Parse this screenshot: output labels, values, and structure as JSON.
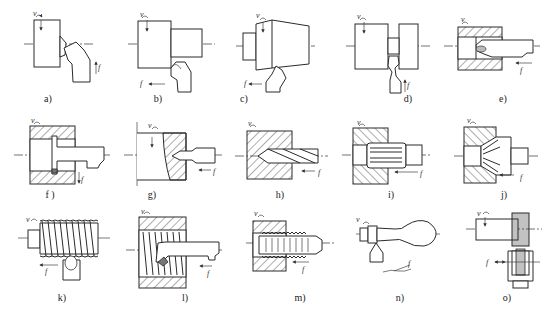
{
  "figure": {
    "symbols": {
      "speed": "v",
      "feed": "f"
    },
    "panels": [
      {
        "id": "a",
        "label": "a)",
        "operation": "facing",
        "label_pos": [
          48,
          100
        ]
      },
      {
        "id": "b",
        "label": "b)",
        "operation": "external cylindrical turning",
        "label_pos": [
          158,
          100
        ]
      },
      {
        "id": "c",
        "label": "c)",
        "operation": "taper turning",
        "label_pos": [
          244,
          100
        ]
      },
      {
        "id": "d",
        "label": "d)",
        "operation": "grooving / parting",
        "label_pos": [
          408,
          100
        ]
      },
      {
        "id": "e",
        "label": "e)",
        "operation": "boring",
        "label_pos": [
          503,
          100
        ]
      },
      {
        "id": "f",
        "label": "f )",
        "operation": "internal grooving",
        "label_pos": [
          50,
          196
        ]
      },
      {
        "id": "g",
        "label": "g)",
        "operation": "center drilling",
        "label_pos": [
          152,
          196
        ]
      },
      {
        "id": "h",
        "label": "h)",
        "operation": "drilling",
        "label_pos": [
          280,
          196
        ]
      },
      {
        "id": "i",
        "label": "i)",
        "operation": "reaming",
        "label_pos": [
          391,
          196
        ]
      },
      {
        "id": "j",
        "label": "j)",
        "operation": "countersinking",
        "label_pos": [
          504,
          196
        ]
      },
      {
        "id": "k",
        "label": "k)",
        "operation": "external threading",
        "label_pos": [
          62,
          300
        ]
      },
      {
        "id": "l",
        "label": "l)",
        "operation": "internal threading",
        "label_pos": [
          185,
          300
        ]
      },
      {
        "id": "m",
        "label": "m)",
        "operation": "tapping",
        "label_pos": [
          300,
          300
        ]
      },
      {
        "id": "n",
        "label": "n)",
        "operation": "form turning",
        "label_pos": [
          400,
          300
        ]
      },
      {
        "id": "o",
        "label": "o)",
        "operation": "knurling",
        "label_pos": [
          507,
          300
        ]
      }
    ]
  }
}
